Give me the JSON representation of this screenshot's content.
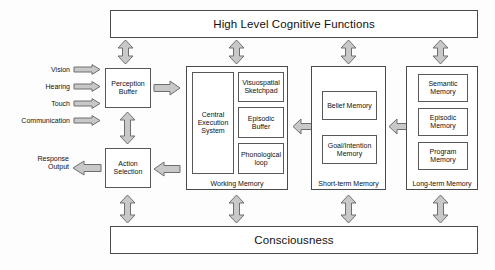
{
  "diagram": {
    "title_top": "High Level Cognitive Functions",
    "title_bottom": "Consciousness",
    "accent_color": "#c8c8c8",
    "outline_color": "#6e6e6e",
    "box_fill": "#ffffff"
  },
  "inputs": {
    "items": [
      {
        "label": "Vision",
        "icon": "arrow-right-icon"
      },
      {
        "label": "Hearing",
        "icon": "arrow-right-icon"
      },
      {
        "label": "Touch",
        "icon": "arrow-right-icon"
      },
      {
        "label": "Communication",
        "icon": "arrow-right-icon"
      }
    ]
  },
  "outputs": {
    "label": "Response\nOutput",
    "label_line1": "Response",
    "label_line2": "Output",
    "icon": "arrow-left-icon"
  },
  "blocks": {
    "perception_buffer": {
      "line1": "Perception",
      "line2": "Buffer"
    },
    "action_selection": {
      "line1": "Action",
      "line2": "Selection"
    }
  },
  "working_memory": {
    "label": "Working Memory",
    "central": {
      "line1": "Central",
      "line2": "Execution",
      "line3": "System"
    },
    "components": [
      {
        "line1": "Visuospatial",
        "line2": "Sketchpad"
      },
      {
        "line1": "Episodic",
        "line2": "Buffer"
      },
      {
        "line1": "Phonological",
        "line2": "loop"
      }
    ]
  },
  "short_term_memory": {
    "label": "Short-term Memory",
    "components": [
      {
        "line1": "Belief Memory",
        "line2": ""
      },
      {
        "line1": "Goal/Intention",
        "line2": "Memory"
      }
    ]
  },
  "long_term_memory": {
    "label": "Long-term Memory",
    "components": [
      {
        "line1": "Semantic",
        "line2": "Memory"
      },
      {
        "line1": "Episodic",
        "line2": "Memory"
      },
      {
        "line1": "Program",
        "line2": "Memory"
      }
    ]
  },
  "connectors": {
    "vertical_double_top": "double-arrow-vertical-icon",
    "vertical_double_bottom": "double-arrow-vertical-icon",
    "horizontal_double": "double-arrow-horizontal-icon",
    "perception_to_wm": "arrow-right-icon",
    "wm_to_action": "arrow-left-icon",
    "perception_action_link": "double-arrow-vertical-icon"
  }
}
